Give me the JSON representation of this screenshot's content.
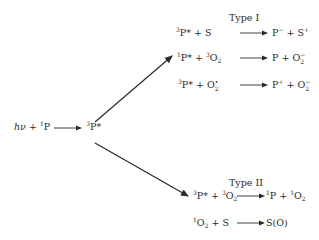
{
  "diagram": {
    "colors": {
      "ink": "#2a2a2a",
      "background": "#ffffff"
    },
    "initial_reaction": {
      "reactant_italic": "hν",
      "plus": "+",
      "reactant2_sup": "1",
      "reactant2": "P",
      "arrow": "⟶",
      "product_sup": "3",
      "product": "P*"
    },
    "type1": {
      "heading": "Type I",
      "reactions": [
        {
          "lhs": [
            {
              "sup": "3",
              "base": "P*"
            },
            {
              "text": " + "
            },
            {
              "base": "S"
            }
          ],
          "rhs": [
            {
              "base": "P",
              "sup": "−"
            },
            {
              "text": " + "
            },
            {
              "base": "S",
              "sup": "+"
            }
          ]
        },
        {
          "lhs": [
            {
              "sup": "1",
              "base": "P*"
            },
            {
              "text": " + "
            },
            {
              "sup": "3",
              "base": "O",
              "sub": "2"
            }
          ],
          "rhs": [
            {
              "base": "P"
            },
            {
              "text": " + "
            },
            {
              "base": "O",
              "sup": "−",
              "sub": "2"
            }
          ]
        },
        {
          "lhs": [
            {
              "sup": "3",
              "base": "P*"
            },
            {
              "text": " + "
            },
            {
              "base": "O",
              "sup": "•",
              "sub": "2"
            }
          ],
          "rhs": [
            {
              "base": "P",
              "sup": "+"
            },
            {
              "text": " + "
            },
            {
              "base": "O",
              "sup": "−",
              "sub": "2"
            }
          ]
        }
      ]
    },
    "type2": {
      "heading": "Type II",
      "reactions": [
        {
          "lhs": [
            {
              "sup": "3",
              "base": "P*"
            },
            {
              "text": " + "
            },
            {
              "sup": "3",
              "base": "O",
              "sub": "2"
            }
          ],
          "rhs": [
            {
              "sup": "1",
              "base": "P"
            },
            {
              "text": " + "
            },
            {
              "sup": "1",
              "base": "O",
              "sub": "2"
            }
          ]
        },
        {
          "lhs": [
            {
              "sup": "1",
              "base": "O",
              "sub": "2"
            },
            {
              "text": " + "
            },
            {
              "base": "S"
            }
          ],
          "rhs": [
            {
              "base": "S(O)"
            }
          ]
        }
      ]
    },
    "branch_arrows": [
      {
        "name": "to-type-I",
        "from": [
          95,
          122
        ],
        "to": [
          172,
          56
        ]
      },
      {
        "name": "to-type-II",
        "from": [
          95,
          143
        ],
        "to": [
          188,
          196
        ]
      }
    ]
  }
}
